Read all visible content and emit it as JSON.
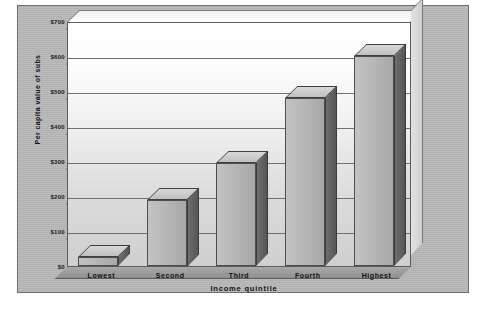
{
  "chart_data": {
    "type": "bar",
    "title": "",
    "subtitle": "",
    "xlabel": "Income quintile",
    "ylabel": "Per capita value of subs",
    "categories": [
      "Lowest",
      "Second",
      "Third",
      "Fourth",
      "Highest"
    ],
    "values": [
      25,
      190,
      295,
      480,
      600
    ],
    "ylim": [
      0,
      700
    ],
    "ytick_values": [
      0,
      100,
      200,
      300,
      400,
      500,
      600,
      700
    ],
    "ytick_labels": [
      "$0",
      "$100",
      "$200",
      "$300",
      "$400",
      "$500",
      "$600",
      "$700"
    ],
    "grid": true,
    "legend": false,
    "legend_position": "none",
    "style": "3d-bar",
    "series": [
      {
        "name": "Per capita value of subs",
        "values": [
          25,
          190,
          295,
          480,
          600
        ]
      }
    ],
    "colors": {
      "bar_face": "#b4b4b4",
      "bar_side": "#5a5a5a",
      "bar_top": "#cbcbcb",
      "plot_background": "#ececec",
      "panel_background": "#b9b9b9",
      "gridline": "#6f6f6f",
      "text": "#111111"
    }
  }
}
